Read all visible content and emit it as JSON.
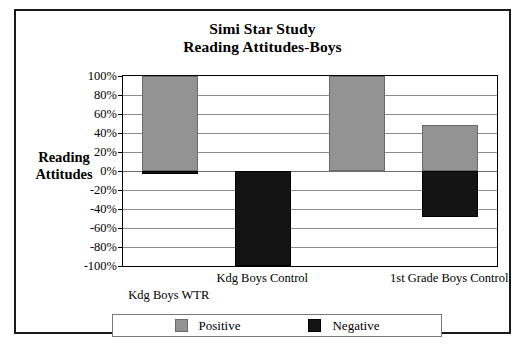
{
  "chart_data": {
    "type": "bar",
    "title": "Simi Star Study",
    "subtitle": "Reading Attitudes-Boys",
    "ylabel_line1": "Reading",
    "ylabel_line2": "Attitudes",
    "xlabel": "",
    "categories": [
      "Kdg Boys WTR",
      "Kdg Boys Control",
      "1st Grade Boys WTR",
      "1st Grade Boys Control"
    ],
    "visible_category_labels": [
      "Kdg Boys WTR",
      "Kdg Boys Control",
      "1st Grade Boys Control"
    ],
    "series": [
      {
        "name": "Positive",
        "color": "#939393",
        "values": [
          100,
          0,
          100,
          48
        ]
      },
      {
        "name": "Negative",
        "color": "#141414",
        "values": [
          -3,
          -100,
          0,
          -48
        ]
      }
    ],
    "ylim": [
      -100,
      100
    ],
    "ytick_step": 20,
    "ytick_labels": [
      "100%",
      "80%",
      "60%",
      "40%",
      "20%",
      "0%",
      "-20%",
      "-40%",
      "-60%",
      "-80%",
      "-100%"
    ],
    "ytick_values": [
      100,
      80,
      60,
      40,
      20,
      0,
      -20,
      -40,
      -60,
      -80,
      -100
    ],
    "grid": true,
    "legend_position": "bottom",
    "stacked_note": "Positive bars rise from 0%; Negative bars drop from 0%"
  },
  "legend": {
    "entries": [
      {
        "label": "Positive",
        "swatch": "positive-swatch"
      },
      {
        "label": "Negative",
        "swatch": "negative-swatch"
      }
    ]
  },
  "colors": {
    "positive": "#939393",
    "negative": "#141414",
    "frame": "#1a1a1a",
    "gridline": "#8d8d8d"
  }
}
